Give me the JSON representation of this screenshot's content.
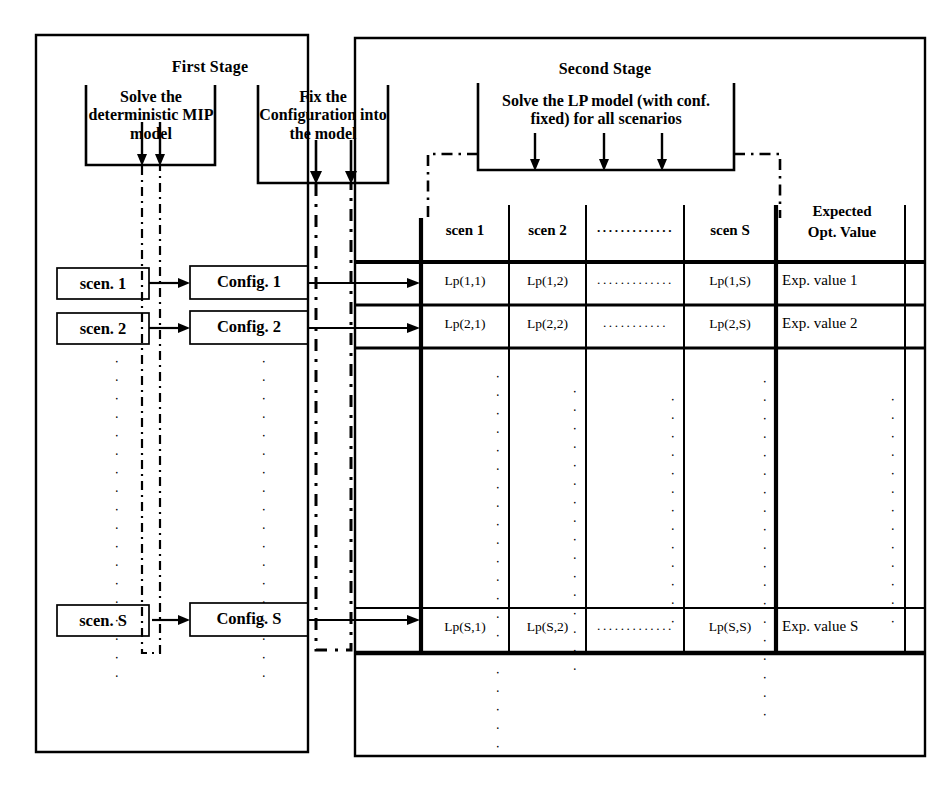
{
  "diagram": {
    "stages": [
      {
        "id": "first",
        "label": "First Stage"
      },
      {
        "id": "second",
        "label": "Second Stage"
      }
    ],
    "process_boxes": [
      {
        "id": "mip",
        "text": "Solve the deterministic MIP model"
      },
      {
        "id": "fix",
        "text": "Fix the Configuration into the model"
      },
      {
        "id": "lp",
        "text": "Solve the LP model (with conf. fixed) for all scenarios"
      }
    ],
    "scenario_nodes": [
      {
        "label": "scen. 1"
      },
      {
        "label": "scen. 2"
      },
      {
        "label": "scen. S"
      }
    ],
    "config_nodes": [
      {
        "label": "Config. 1"
      },
      {
        "label": "Config. 2"
      },
      {
        "label": "Config. S"
      }
    ],
    "vertical_ellipsis": "⋮",
    "horizontal_ellipsis": "·············",
    "table": {
      "headers": [
        "scen 1",
        "scen 2",
        "·············",
        "scen S",
        "Expected Opt. Value"
      ],
      "header_expected_line1": "Expected",
      "header_expected_line2": "Opt. Value",
      "rows": [
        {
          "id": "row1",
          "cells": [
            "Lp(1,1)",
            "Lp(1,2)",
            "·············",
            "Lp(1,S)"
          ],
          "expected": "Exp. value  1"
        },
        {
          "id": "row2",
          "cells": [
            "Lp(2,1)",
            "Lp(2,2)",
            "···········",
            "Lp(2,S)"
          ],
          "expected": "Exp. value  2"
        },
        {
          "id": "rowS",
          "cells": [
            "Lp(S,1)",
            "Lp(S,2)",
            "·············",
            "Lp(S,S)"
          ],
          "expected": "Exp. value  S"
        }
      ]
    },
    "colors": {
      "ink": "#000000",
      "paper": "#ffffff"
    }
  }
}
